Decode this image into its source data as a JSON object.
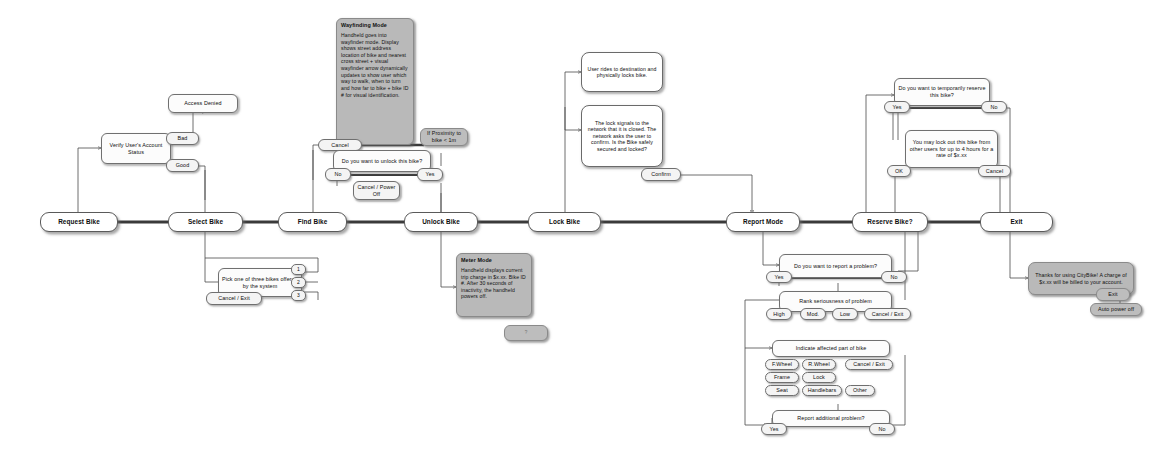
{
  "diagram": {
    "colors": {
      "node_fill": "#fefefe",
      "grey_fill": "#b9b9b9",
      "stroke": "#6b6b6b",
      "wire": "#4a4a4a",
      "text": "#0d0d0d"
    }
  },
  "spine": {
    "steps": [
      {
        "label": "Request Bike"
      },
      {
        "label": "Select Bike"
      },
      {
        "label": "Find Bike"
      },
      {
        "label": "Unlock Bike"
      },
      {
        "label": "Lock Bike"
      },
      {
        "label": "Report Mode"
      },
      {
        "label": "Reserve Bike?"
      },
      {
        "label": "Exit"
      }
    ]
  },
  "request_branch": {
    "verify": "Verify User's Account Status",
    "bad_label": "Bad",
    "good_label": "Good",
    "access_denied": "Access Denied"
  },
  "select_branch": {
    "prompt": "Pick one of three bikes offered by the system",
    "options": [
      "1",
      "2",
      "3"
    ],
    "cancel": "Cancel / Exit"
  },
  "find_branch": {
    "mode_title": "Wayfinding Mode",
    "mode_body": "Handheld goes into wayfinder mode. Display shows street address location of bike and nearest cross street + visual wayfinder arrow dynamically updates to show user which way to walk, when to turn and how far to bike + bike ID # for visual identification.",
    "cancel": "Cancel",
    "proximity": "If Proximity to bike < 1m"
  },
  "unlock_branch": {
    "prompt": "Do you want to unlock this bike?",
    "no_label": "No",
    "yes_label": "Yes",
    "cancel_power_off": "Cancel / Power Off",
    "meter_title": "Meter Mode",
    "meter_body": "Handheld displays current trip charge in $x.xx. Bike ID #. After 30 seconds of inactivity, the handheld powers off.",
    "meter_button": "?"
  },
  "lock_branch": {
    "ride_note": "User rides to destination and physically locks bike.",
    "confirm_note": "The lock signals to the network that it is closed. The network asks the user to confirm. Is the Bike safely secured and locked?",
    "confirm_button": "Confirm"
  },
  "report_branch": {
    "q1": "Do you want to report a problem?",
    "q1_yes": "Yes",
    "q1_no": "No",
    "q2": "Rank seriousness of problem",
    "q2_options": [
      "High",
      "Mod.",
      "Low",
      "Cancel / Exit"
    ],
    "q3": "Indicate affected part of bike",
    "q3_options": [
      "F.Wheel",
      "R.Wheel",
      "Cancel / Exit",
      "Frame",
      "Lock",
      "Seat",
      "Handlebars",
      "Other"
    ],
    "q4": "Report additional problem?",
    "q4_yes": "Yes",
    "q4_no": "No"
  },
  "reserve_branch": {
    "q1": "Do you want to temporarily reserve this bike?",
    "q1_yes": "Yes",
    "q1_no": "No",
    "info": "You may lock out this bike from other users for up to 4 hours for a rate of $x.xx",
    "ok": "OK",
    "cancel": "Cancel"
  },
  "exit_branch": {
    "thanks": "Thanks for using CityBike! A charge of $x.xx will be billed to your account.",
    "exit_button": "Exit",
    "auto_power_off": "Auto power off"
  }
}
